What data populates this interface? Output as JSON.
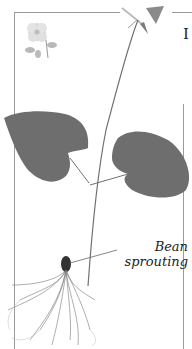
{
  "page": {
    "letter": "I",
    "caption": {
      "line1": "Bean",
      "line2": "sprouting"
    }
  },
  "illustration": {
    "subject": "bean-seedling-with-roots",
    "decoration": "flower-icon",
    "colors": {
      "leaf": "#6e6e6e",
      "stem": "#707070",
      "frame": "#9a9a9a",
      "text": "#222222"
    }
  }
}
